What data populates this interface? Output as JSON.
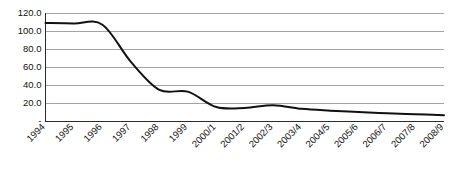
{
  "chart_data": {
    "type": "line",
    "title": "",
    "subtitle": "",
    "xlabel": "",
    "ylabel": "",
    "grid": true,
    "legend": false,
    "legend_position": "none",
    "line_color": "#111111",
    "grid_color": "#9a9a9a",
    "axis_color": "#2b2b2b",
    "ylim": [
      0,
      120
    ],
    "ytick_values": [
      0,
      20,
      40,
      60,
      80,
      100,
      120
    ],
    "ytick_labels": [
      "-",
      "20.0",
      "40.0",
      "60.0",
      "80.0",
      "100.0",
      "120.0"
    ],
    "categories": [
      "1994",
      "1995",
      "1996",
      "1997",
      "1998",
      "1999",
      "2000/1",
      "2001/2",
      "2002/3",
      "2003/4",
      "2004/5",
      "2005/6",
      "2006/7",
      "2007/8",
      "2008/9"
    ],
    "values": [
      109,
      108.5,
      107,
      66,
      35,
      33,
      16,
      15,
      18,
      14,
      12,
      10.5,
      9,
      8,
      7
    ],
    "xtick_rotation_deg": 45
  }
}
